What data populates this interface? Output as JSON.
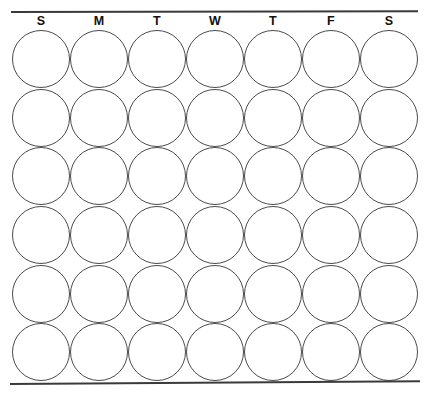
{
  "sheet": {
    "title": "Weekly Circle Tracker Grid",
    "background_color": "#ffffff",
    "rule_color": "#3a3a3a",
    "circle_stroke_color": "#4a4a4a",
    "label_color": "#111111"
  },
  "header": {
    "name": "weekday-header",
    "weekdays": [
      {
        "label": "S",
        "day": "Sunday"
      },
      {
        "label": "M",
        "day": "Monday"
      },
      {
        "label": "T",
        "day": "Tuesday"
      },
      {
        "label": "W",
        "day": "Wednesday"
      },
      {
        "label": "T",
        "day": "Thursday"
      },
      {
        "label": "F",
        "day": "Friday"
      },
      {
        "label": "S",
        "day": "Saturday"
      }
    ]
  },
  "grid": {
    "columns": 7,
    "rows": 6,
    "total_circles": 42,
    "circle_state": "empty",
    "cells": [
      [
        "",
        "",
        "",
        "",
        "",
        "",
        ""
      ],
      [
        "",
        "",
        "",
        "",
        "",
        "",
        ""
      ],
      [
        "",
        "",
        "",
        "",
        "",
        "",
        ""
      ],
      [
        "",
        "",
        "",
        "",
        "",
        "",
        ""
      ],
      [
        "",
        "",
        "",
        "",
        "",
        "",
        ""
      ],
      [
        "",
        "",
        "",
        "",
        "",
        "",
        ""
      ]
    ]
  }
}
